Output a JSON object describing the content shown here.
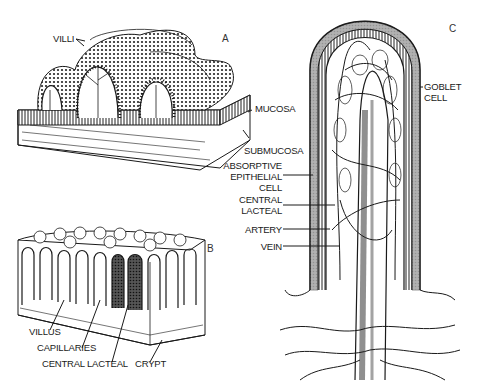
{
  "figure": {
    "panels": {
      "A": {
        "letter": "A",
        "labels": {
          "villi": "VILLI",
          "mucosa": "MUCOSA",
          "submucosa": "SUBMUCOSA"
        }
      },
      "B": {
        "letter": "B",
        "labels": {
          "villus": "VILLUS",
          "capillaries": "CAPILLARIES",
          "central_lacteal": "CENTRAL LACTEAL",
          "crypt": "CRYPT"
        }
      },
      "C": {
        "letter": "C",
        "labels": {
          "absorptive_1": "ABSORPTIVE",
          "absorptive_2": "EPITHELIAL",
          "absorptive_3": "CELL",
          "central_1": "CENTRAL",
          "central_2": "LACTEAL",
          "artery": "ARTERY",
          "vein": "VEIN",
          "goblet_1": "GOBLET",
          "goblet_2": "CELL"
        }
      }
    },
    "colors": {
      "ink": "#1a1a1a",
      "background": "#ffffff"
    }
  }
}
